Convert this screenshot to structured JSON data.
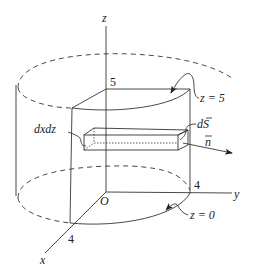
{
  "figure": {
    "axes": {
      "z_label": "z",
      "y_label": "y",
      "x_label": "x",
      "origin_label": "O"
    },
    "ticks": {
      "z_height": "5",
      "y_radius": "4",
      "x_radius": "4"
    },
    "annotations": {
      "top_surface": "z = 5",
      "bottom_surface": "z = 0",
      "area_element": "dxdz",
      "surface_vector": "dS",
      "normal_vector": "n"
    },
    "colors": {
      "line": "#333333",
      "background": "#ffffff"
    }
  }
}
